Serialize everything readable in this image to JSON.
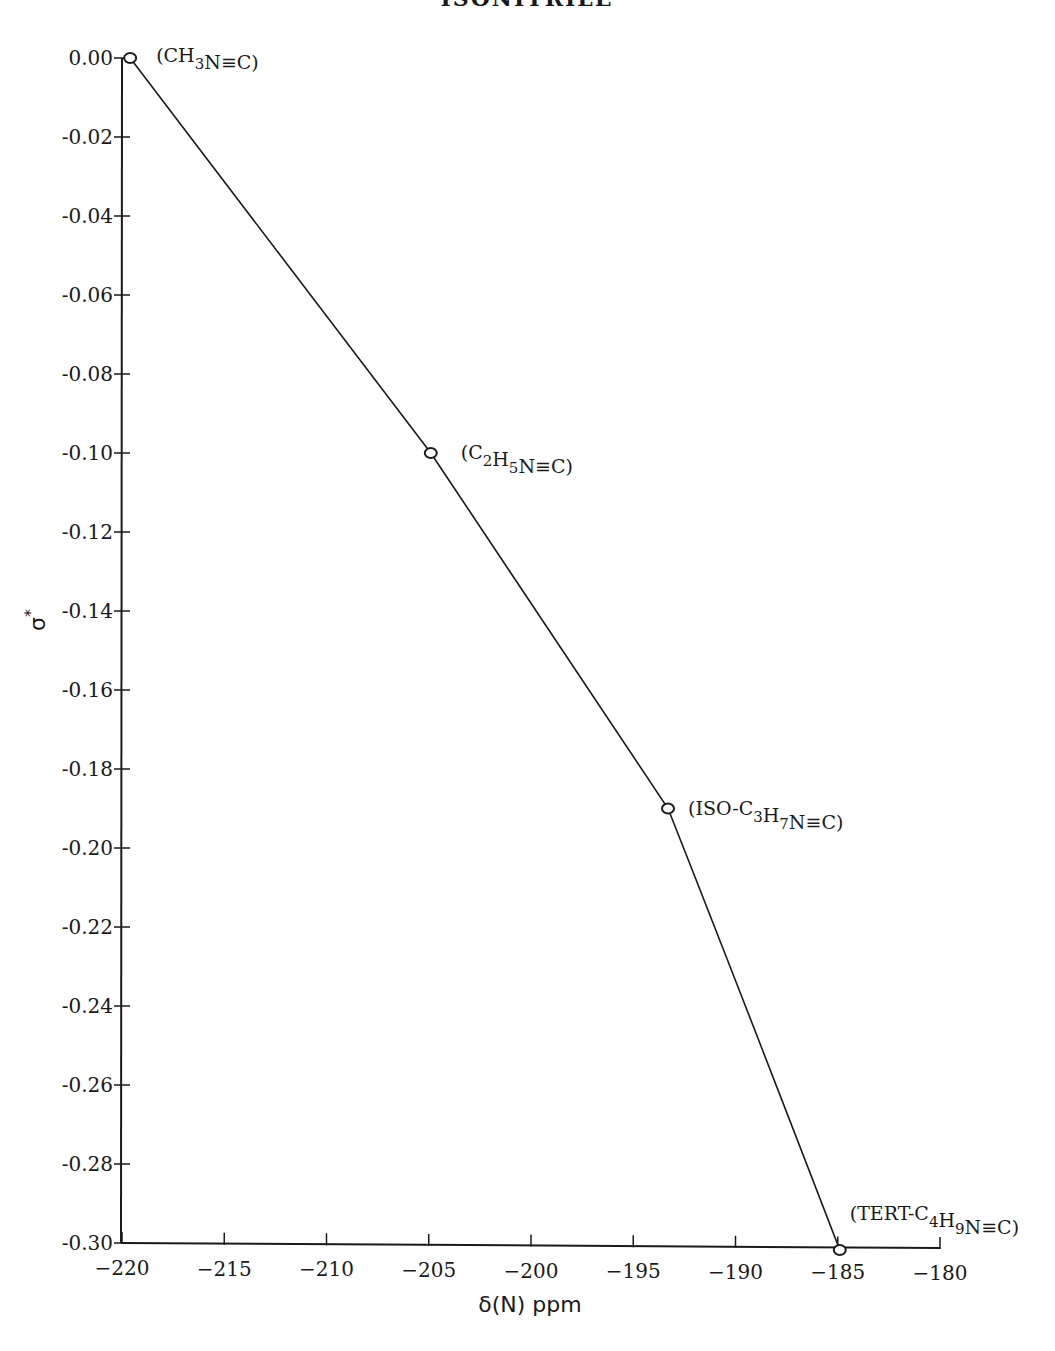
{
  "page": {
    "title": "ISONITRILE"
  },
  "chart_data": {
    "type": "line",
    "title": "ISONITRILE",
    "xlabel": "δ(N) ppm",
    "ylabel": "σ*",
    "xlim": [
      -220,
      -180
    ],
    "ylim": [
      -0.3,
      0.0
    ],
    "grid": false,
    "legend": null,
    "x_ticks": [
      -220,
      -215,
      -210,
      -205,
      -200,
      -195,
      -190,
      -185,
      -180
    ],
    "x_tick_labels": [
      "−220",
      "−215",
      "−210",
      "−205",
      "−200",
      "−195",
      "−190",
      "−185",
      "−180"
    ],
    "y_ticks": [
      0.0,
      -0.02,
      -0.04,
      -0.06,
      -0.08,
      -0.1,
      -0.12,
      -0.14,
      -0.16,
      -0.18,
      -0.2,
      -0.22,
      -0.24,
      -0.26,
      -0.28,
      -0.3
    ],
    "y_tick_labels": [
      "0.00",
      "-0.02",
      "-0.04",
      "-0.06",
      "-0.08",
      "-0.10",
      "-0.12",
      "-0.14",
      "-0.16",
      "-0.18",
      "-0.20",
      "-0.22",
      "-0.24",
      "-0.26",
      "-0.28",
      "-0.30"
    ],
    "series": [
      {
        "name": "isonitriles",
        "marker": "open-circle",
        "points": [
          {
            "x": -219.6,
            "y": 0.0,
            "label": "(CH3N≡C)",
            "label_parts": [
              [
                "(CH",
                ""
              ],
              [
                "3",
                "sub"
              ],
              [
                "N≡C)",
                ""
              ]
            ]
          },
          {
            "x": -204.9,
            "y": -0.1,
            "label": "(C2H5N≡C)",
            "label_parts": [
              [
                "(C",
                ""
              ],
              [
                "2",
                "sub"
              ],
              [
                "H",
                ""
              ],
              [
                "5",
                "sub"
              ],
              [
                "N≡C)",
                ""
              ]
            ]
          },
          {
            "x": -193.3,
            "y": -0.19,
            "label": "(ISO-C3H7N≡C)",
            "label_parts": [
              [
                "(ISO-C",
                ""
              ],
              [
                "3",
                "sub"
              ],
              [
                "H",
                ""
              ],
              [
                "7",
                "sub"
              ],
              [
                "N≡C)",
                ""
              ]
            ]
          },
          {
            "x": -184.9,
            "y": -0.3,
            "label": "(TERT-C4H9N≡C)",
            "label_parts": [
              [
                "(TERT-C",
                ""
              ],
              [
                "4",
                "sub"
              ],
              [
                "H",
                ""
              ],
              [
                "9",
                "sub"
              ],
              [
                "N≡C)",
                ""
              ]
            ]
          }
        ]
      }
    ]
  },
  "style": {
    "ink": "#1a1a1a",
    "background": "#ffffff"
  }
}
